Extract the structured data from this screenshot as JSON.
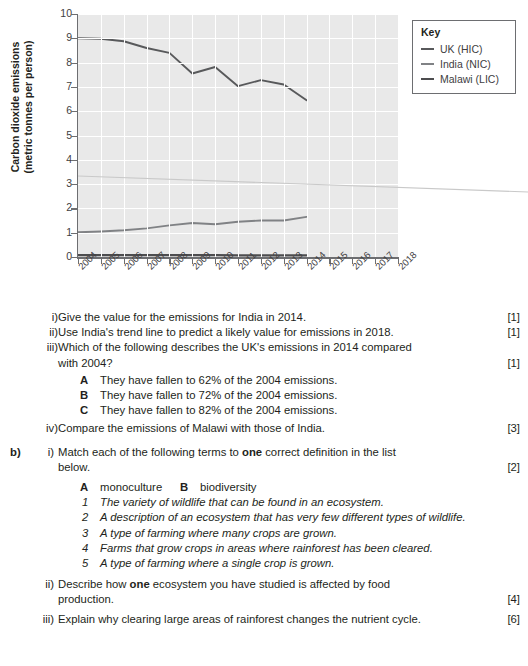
{
  "top_strip_text": "",
  "chart_data": {
    "type": "line",
    "title": "",
    "xlabel": "",
    "ylabel": "Carbon dioxide emissions (metric tonnes per person)",
    "ylabel_line1": "Carbon dioxide emissions",
    "ylabel_line2": "(metric tonnes per person)",
    "x": [
      2004,
      2005,
      2006,
      2007,
      2008,
      2009,
      2010,
      2011,
      2012,
      2013,
      2014,
      2015,
      2016,
      2017,
      2018
    ],
    "xticks": [
      "2004",
      "2005",
      "2006",
      "2007",
      "2008",
      "2009",
      "2010",
      "2011",
      "2012",
      "2013",
      "2014",
      "2015",
      "2016",
      "2017",
      "2018"
    ],
    "yticks": [
      "0",
      "1",
      "2",
      "3",
      "4",
      "5",
      "6",
      "7",
      "8",
      "9",
      "10"
    ],
    "ylim": [
      0,
      10
    ],
    "xlim": [
      2004,
      2018
    ],
    "grid": true,
    "legend_position": "outside-top-right",
    "legend_title": "Key",
    "series": [
      {
        "name": "UK (HIC)",
        "color": "#58595b",
        "x": [
          2004,
          2005,
          2006,
          2007,
          2008,
          2009,
          2010,
          2011,
          2012,
          2013,
          2014
        ],
        "values": [
          9.0,
          8.98,
          8.88,
          8.6,
          8.4,
          7.55,
          7.82,
          7.03,
          7.28,
          7.1,
          6.45
        ]
      },
      {
        "name": "India (NIC)",
        "color": "#808285",
        "x": [
          2004,
          2005,
          2006,
          2007,
          2008,
          2009,
          2010,
          2011,
          2012,
          2013,
          2014
        ],
        "values": [
          1.02,
          1.05,
          1.1,
          1.18,
          1.3,
          1.4,
          1.35,
          1.45,
          1.5,
          1.5,
          1.65
        ]
      },
      {
        "name": "Malawi (LIC)",
        "color": "#4d4d4f",
        "x": [
          2004,
          2005,
          2006,
          2007,
          2008,
          2009,
          2010,
          2011,
          2012,
          2013,
          2014
        ],
        "values": [
          0.08,
          0.08,
          0.08,
          0.08,
          0.08,
          0.08,
          0.08,
          0.07,
          0.07,
          0.07,
          0.07
        ]
      }
    ]
  },
  "key": {
    "title": "Key",
    "items": [
      {
        "label": "UK (HIC)"
      },
      {
        "label": "India (NIC)"
      },
      {
        "label": "Malawi (LIC)"
      }
    ]
  },
  "questions": {
    "part_a": {
      "sub": [
        {
          "rn": "i)",
          "text": "Give the value for the emissions for India in 2014.",
          "marks": "[1]"
        },
        {
          "rn": "ii)",
          "text": "Use India's trend line to predict a likely value for emissions in 2018.",
          "marks": "[1]"
        },
        {
          "rn": "iii)",
          "text_line1": "Which of the following describes the UK's emissions in 2014 compared",
          "text_line2": "with 2004?",
          "marks": "[1]"
        },
        {
          "rn": "iv)",
          "text": "Compare the emissions of Malawi with those of India.",
          "marks": "[3]"
        }
      ],
      "options": [
        {
          "letter": "A",
          "text": "They have fallen to 62% of the 2004 emissions."
        },
        {
          "letter": "B",
          "text": "They have fallen to 72% of the 2004 emissions."
        },
        {
          "letter": "C",
          "text": "They have fallen to 82% of the 2004 emissions."
        }
      ]
    },
    "part_b": {
      "letter": "b)",
      "sub": [
        {
          "rn": "i)",
          "text_pre": "Match each of the following terms to ",
          "text_bold": "one",
          "text_post": " correct definition in the list",
          "text_line2": "below.",
          "marks": "[2]"
        },
        {
          "rn": "ii)",
          "text_pre": "Describe how ",
          "text_bold": "one",
          "text_post": " ecosystem you have studied is affected by food",
          "text_line2": "production.",
          "marks": "[4]"
        },
        {
          "rn": "iii)",
          "text": "Explain why clearing large areas of rainforest changes the nutrient cycle.",
          "marks": "[6]"
        }
      ],
      "terms": [
        {
          "letter": "A",
          "text": "monoculture"
        },
        {
          "letter": "B",
          "text": "biodiversity"
        }
      ],
      "definitions": [
        {
          "num": "1",
          "text": "The variety of wildlife that can be found in an ecosystem."
        },
        {
          "num": "2",
          "text": "A description of an ecosystem that has very few different types of wildlife."
        },
        {
          "num": "3",
          "text": "A type of farming where many crops are grown."
        },
        {
          "num": "4",
          "text": "Farms that grow crops in areas where rainforest has been cleared."
        },
        {
          "num": "5",
          "text": "A type of farming where a single crop is grown."
        }
      ]
    }
  }
}
